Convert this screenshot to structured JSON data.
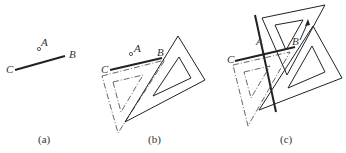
{
  "panels": [
    {
      "caption": "(a)",
      "labels": {
        "A": "A",
        "B": "B",
        "C": "C"
      }
    },
    {
      "caption": "(b)",
      "labels": {
        "A": "A",
        "B": "B",
        "C": "C"
      }
    },
    {
      "caption": "(c)",
      "labels": {
        "A": "A",
        "B": "B",
        "C": "C"
      }
    }
  ],
  "colors": {
    "line": "#222222",
    "dashed": "#555555"
  }
}
